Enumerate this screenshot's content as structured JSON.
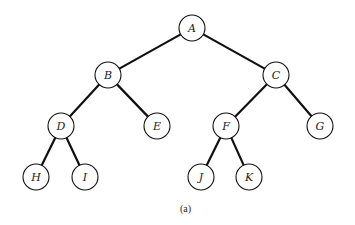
{
  "diagram": {
    "type": "binary-tree",
    "caption": "(a)",
    "node_radius": 13,
    "nodes": [
      {
        "id": "A",
        "label": "A",
        "x": 192,
        "y": 28
      },
      {
        "id": "B",
        "label": "B",
        "x": 108,
        "y": 75
      },
      {
        "id": "C",
        "label": "C",
        "x": 276,
        "y": 75
      },
      {
        "id": "D",
        "label": "D",
        "x": 61,
        "y": 126
      },
      {
        "id": "E",
        "label": "E",
        "x": 157,
        "y": 126
      },
      {
        "id": "F",
        "label": "F",
        "x": 226,
        "y": 126
      },
      {
        "id": "G",
        "label": "G",
        "x": 320,
        "y": 126
      },
      {
        "id": "H",
        "label": "H",
        "x": 36,
        "y": 177
      },
      {
        "id": "I",
        "label": "I",
        "x": 85,
        "y": 177
      },
      {
        "id": "J",
        "label": "J",
        "x": 201,
        "y": 177
      },
      {
        "id": "K",
        "label": "K",
        "x": 249,
        "y": 177
      }
    ],
    "edges": [
      [
        "A",
        "B"
      ],
      [
        "A",
        "C"
      ],
      [
        "B",
        "D"
      ],
      [
        "B",
        "E"
      ],
      [
        "C",
        "F"
      ],
      [
        "C",
        "G"
      ],
      [
        "D",
        "H"
      ],
      [
        "D",
        "I"
      ],
      [
        "F",
        "J"
      ],
      [
        "F",
        "K"
      ]
    ]
  }
}
